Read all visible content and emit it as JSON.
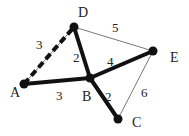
{
  "graph": {
    "nodes": [
      {
        "id": "A",
        "x": 24,
        "y": 84,
        "label_x": 10,
        "label_y": 97
      },
      {
        "id": "B",
        "x": 90,
        "y": 78,
        "label_x": 82,
        "label_y": 101
      },
      {
        "id": "C",
        "x": 118,
        "y": 119,
        "label_x": 132,
        "label_y": 127
      },
      {
        "id": "D",
        "x": 74,
        "y": 27,
        "label_x": 78,
        "label_y": 17
      },
      {
        "id": "E",
        "x": 153,
        "y": 51,
        "label_x": 170,
        "label_y": 62
      }
    ],
    "edges": [
      {
        "from": "A",
        "to": "D",
        "weight": "3",
        "style": "dashed",
        "wx": 36,
        "wy": 49
      },
      {
        "from": "A",
        "to": "B",
        "weight": "3",
        "style": "thick",
        "wx": 56,
        "wy": 100
      },
      {
        "from": "D",
        "to": "B",
        "weight": "2",
        "style": "thick",
        "wx": 73,
        "wy": 62
      },
      {
        "from": "D",
        "to": "E",
        "weight": "5",
        "style": "thin",
        "wx": 112,
        "wy": 32
      },
      {
        "from": "B",
        "to": "E",
        "weight": "4",
        "style": "thick",
        "wx": 107,
        "wy": 66
      },
      {
        "from": "B",
        "to": "C",
        "weight": "2",
        "style": "thick",
        "wx": 105,
        "wy": 101
      },
      {
        "from": "E",
        "to": "C",
        "weight": "6",
        "style": "thin",
        "wx": 141,
        "wy": 97
      }
    ]
  }
}
